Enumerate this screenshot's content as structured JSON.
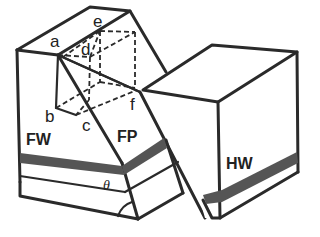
{
  "diagram": {
    "type": "fault block diagram",
    "blocks": {
      "footwall": "FW",
      "fault_plane": "FP",
      "hanging_wall": "HW"
    },
    "points": {
      "a": "a",
      "b": "b",
      "c": "c",
      "d": "d",
      "e": "e",
      "f": "f"
    },
    "angle": "θ",
    "colors": {
      "line": "#2a2a2a",
      "bed": "#555555",
      "background": "#ffffff"
    }
  }
}
